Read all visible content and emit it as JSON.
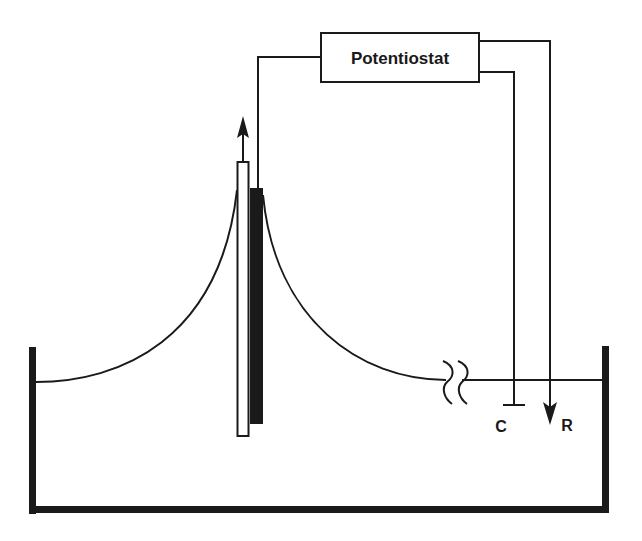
{
  "diagram": {
    "potentiostat": {
      "label": "Potentiostat"
    },
    "electrodes": {
      "counter": {
        "label": "C"
      },
      "reference": {
        "label": "R"
      }
    },
    "colors": {
      "ink": "#1a1a1a",
      "background": "#ffffff"
    }
  }
}
